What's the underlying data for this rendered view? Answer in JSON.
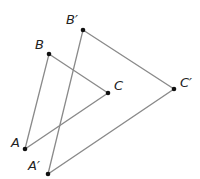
{
  "diagram": {
    "type": "geometric-translation",
    "line_color": "#8a8a8a",
    "point_color": "#111111",
    "triangles": [
      {
        "name": "original",
        "points": {
          "A": [
            25,
            149
          ],
          "B": [
            49,
            54
          ],
          "C": [
            108,
            93
          ]
        }
      },
      {
        "name": "image",
        "points": {
          "A'": [
            48,
            174
          ],
          "B'": [
            83,
            30
          ],
          "C'": [
            174,
            89
          ]
        }
      }
    ],
    "labels": [
      {
        "text": "A",
        "x": 11,
        "y": 147
      },
      {
        "text": "B",
        "x": 35,
        "y": 49
      },
      {
        "text": "C",
        "x": 114,
        "y": 90
      },
      {
        "text": "A′",
        "x": 28,
        "y": 170
      },
      {
        "text": "B′",
        "x": 66,
        "y": 24
      },
      {
        "text": "C′",
        "x": 180,
        "y": 87
      }
    ]
  }
}
